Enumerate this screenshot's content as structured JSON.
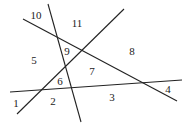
{
  "diagram": {
    "type": "line-arrangement",
    "stroke_color": "#222222",
    "lines": [
      {
        "id": "A",
        "x1": 48,
        "y1": 4,
        "x2": 81,
        "y2": 122
      },
      {
        "id": "B",
        "x1": 23,
        "y1": 19,
        "x2": 177,
        "y2": 101
      },
      {
        "id": "C",
        "x1": 17,
        "y1": 114,
        "x2": 124,
        "y2": 9
      },
      {
        "id": "D",
        "x1": 10,
        "y1": 92,
        "x2": 182,
        "y2": 80
      }
    ],
    "regions": [
      {
        "label": "1",
        "x": 16,
        "y": 103
      },
      {
        "label": "2",
        "x": 53,
        "y": 101
      },
      {
        "label": "3",
        "x": 112,
        "y": 97
      },
      {
        "label": "4",
        "x": 168,
        "y": 89
      },
      {
        "label": "5",
        "x": 34,
        "y": 60
      },
      {
        "label": "6",
        "x": 60,
        "y": 81
      },
      {
        "label": "7",
        "x": 92,
        "y": 71
      },
      {
        "label": "8",
        "x": 132,
        "y": 51
      },
      {
        "label": "9",
        "x": 67,
        "y": 51
      },
      {
        "label": "10",
        "x": 36,
        "y": 15
      },
      {
        "label": "11",
        "x": 77,
        "y": 23
      }
    ]
  }
}
